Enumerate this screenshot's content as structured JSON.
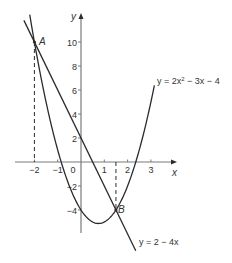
{
  "chart_data": {
    "type": "line",
    "title": "",
    "xlabel": "x",
    "ylabel": "y",
    "xlim": [
      -2.8,
      4.0
    ],
    "ylim": [
      -6,
      12
    ],
    "grid": false,
    "x_ticks": [
      -2,
      -1,
      0,
      1,
      2,
      3
    ],
    "x_tick_labels": [
      "−2",
      "−1",
      "0",
      "1",
      "2",
      "3"
    ],
    "y_ticks": [
      10,
      8,
      6,
      4,
      2,
      -2,
      -4
    ],
    "y_tick_labels": [
      "10",
      "8",
      "6",
      "4",
      "2",
      "−2",
      "−4"
    ],
    "series": [
      {
        "name": "y = 2x² − 3x − 4",
        "label_parts": [
          "y = 2x",
          "2",
          " − 3x − 4"
        ],
        "equation": "2x^2 - 3x - 4",
        "x_range": [
          -2.2,
          3.15
        ],
        "x": [
          -2.2,
          -2,
          -1.5,
          -1,
          -0.5,
          0,
          0.5,
          0.75,
          1,
          1.5,
          2,
          2.5,
          3,
          3.15
        ],
        "values": [
          12.28,
          10,
          4.5,
          1,
          -2,
          -4,
          -5,
          -5.125,
          -5,
          -4,
          -2,
          1,
          5,
          6.4
        ]
      },
      {
        "name": "y = 2 − 4x",
        "label_parts": [
          "y = 2 − 4x"
        ],
        "equation": "2 - 4x",
        "x_range": [
          -2.45,
          2.35
        ],
        "x": [
          -2.45,
          2.35
        ],
        "values": [
          11.8,
          -7.4
        ]
      }
    ],
    "annotations": [
      {
        "label": "A",
        "x": -2,
        "y": 10,
        "dashed_drop_to_x_axis": true
      },
      {
        "label": "B",
        "x": 1.5,
        "y": -4,
        "dashed_drop_to_x_axis": true
      }
    ]
  },
  "labels": {
    "x_axis": "x",
    "y_axis": "y",
    "point_a": "A",
    "point_b": "B",
    "parabola_eq_pre": "y = 2x",
    "parabola_eq_sup": "2",
    "parabola_eq_post": " − 3x − 4",
    "line_eq": "y = 2 − 4x"
  },
  "colors": {
    "curve": "#2b2b2b",
    "axis": "#7a7a7a",
    "text": "#333333"
  }
}
